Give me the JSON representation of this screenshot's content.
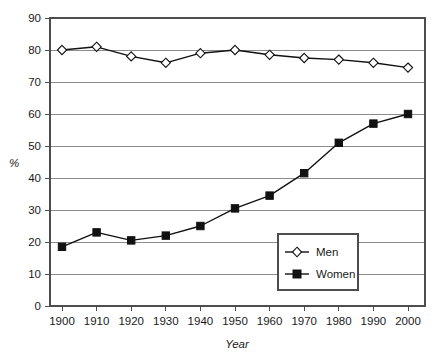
{
  "chart_data": {
    "type": "line",
    "title": "",
    "subtitle": "",
    "xlabel": "Year",
    "ylabel": "%",
    "x": [
      1900,
      1910,
      1920,
      1930,
      1940,
      1950,
      1960,
      1970,
      1980,
      1990,
      2000
    ],
    "categories": [
      "1900",
      "1910",
      "1920",
      "1930",
      "1940",
      "1950",
      "1960",
      "1970",
      "1980",
      "1990",
      "2000"
    ],
    "series": [
      {
        "name": "Men",
        "marker": "open-diamond",
        "color": "#111111",
        "values": [
          80.0,
          81.0,
          78.0,
          76.0,
          79.0,
          80.0,
          78.5,
          77.5,
          77.0,
          76.0,
          74.5
        ]
      },
      {
        "name": "Women",
        "marker": "filled-square",
        "color": "#111111",
        "values": [
          18.5,
          23.0,
          20.5,
          22.0,
          25.0,
          30.5,
          34.5,
          41.5,
          51.0,
          57.0,
          60.0
        ]
      }
    ],
    "xlim": [
      1895,
      2005
    ],
    "ylim": [
      0,
      90
    ],
    "yticks": [
      0,
      10,
      20,
      30,
      40,
      50,
      60,
      70,
      80,
      90
    ],
    "ytick_labels": [
      "0",
      "10",
      "20",
      "30",
      "40",
      "50",
      "60",
      "70",
      "80",
      "90"
    ],
    "xtick_labels": [
      "1900",
      "1910",
      "1920",
      "1930",
      "1940",
      "1950",
      "1960",
      "1970",
      "1980",
      "1990",
      "2000"
    ],
    "grid": "horizontal",
    "legend_position": "center-right-inside",
    "legend_entries": [
      "Men",
      "Women"
    ]
  },
  "legend": {
    "men_label": "Men",
    "women_label": "Women"
  },
  "axes": {
    "y_title": "%",
    "x_title": "Year"
  }
}
